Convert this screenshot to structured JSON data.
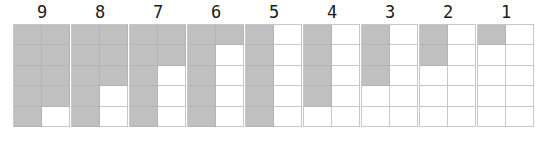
{
  "display": {
    "title": "Numerosity grid array",
    "background_color": "#ffffff",
    "filled_cell_color": "#c0c0c0",
    "empty_cell_color": "#ffffff",
    "grid_line_color": "#c8c8c8",
    "label_color": "#1a1a1a",
    "grid_columns": 2,
    "grid_rows": 5,
    "cells_per_grid": 10
  },
  "groups": [
    {
      "label": "9",
      "filled_count": 9,
      "cells": [
        1,
        1,
        1,
        1,
        1,
        1,
        1,
        1,
        1,
        0
      ]
    },
    {
      "label": "8",
      "filled_count": 8,
      "cells": [
        1,
        1,
        1,
        1,
        1,
        1,
        1,
        0,
        1,
        0
      ]
    },
    {
      "label": "7",
      "filled_count": 7,
      "cells": [
        1,
        1,
        1,
        1,
        1,
        0,
        1,
        0,
        1,
        0
      ]
    },
    {
      "label": "6",
      "filled_count": 6,
      "cells": [
        1,
        1,
        1,
        0,
        1,
        0,
        1,
        0,
        1,
        0
      ]
    },
    {
      "label": "5",
      "filled_count": 5,
      "cells": [
        1,
        0,
        1,
        0,
        1,
        0,
        1,
        0,
        1,
        0
      ]
    },
    {
      "label": "4",
      "filled_count": 4,
      "cells": [
        1,
        0,
        1,
        0,
        1,
        0,
        1,
        0,
        0,
        0
      ]
    },
    {
      "label": "3",
      "filled_count": 3,
      "cells": [
        1,
        0,
        1,
        0,
        1,
        0,
        0,
        0,
        0,
        0
      ]
    },
    {
      "label": "2",
      "filled_count": 2,
      "cells": [
        1,
        0,
        1,
        0,
        0,
        0,
        0,
        0,
        0,
        0
      ]
    },
    {
      "label": "1",
      "filled_count": 1,
      "cells": [
        1,
        0,
        0,
        0,
        0,
        0,
        0,
        0,
        0,
        0
      ]
    }
  ],
  "chart_data": {
    "type": "bar",
    "xlabel": "",
    "ylabel": "",
    "categories": [
      "9",
      "8",
      "7",
      "6",
      "5",
      "4",
      "3",
      "2",
      "1"
    ],
    "values": [
      9,
      8,
      7,
      6,
      5,
      4,
      3,
      2,
      1
    ],
    "ylim": [
      0,
      10
    ],
    "grid": true,
    "legend": "none",
    "note": "Each group is a 2x5 cell grid; the number of shaded cells equals the numeral printed above it."
  }
}
